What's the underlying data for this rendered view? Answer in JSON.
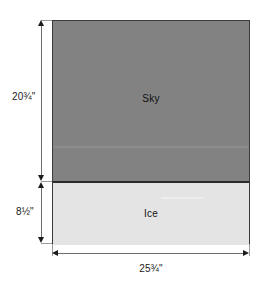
{
  "diagram": {
    "regions": [
      {
        "name": "sky",
        "label": "Sky",
        "height_label": "20¾\"",
        "color": "#828282"
      },
      {
        "name": "ice",
        "label": "Ice",
        "height_label": "8½\"",
        "color": "#e4e4e4"
      }
    ],
    "width_label": "25¾\"",
    "unit": "inches",
    "colors": {
      "sky_fill": "#828282",
      "ice_fill": "#e4e4e4",
      "outline": "#3a3a3a",
      "divider": "#2b2b2b",
      "dimension_line": "#6f6f6f",
      "witness_line": "#9a9a9a",
      "arrow": "#1c1c1c",
      "background": "#ffffff"
    }
  }
}
